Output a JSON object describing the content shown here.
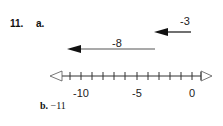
{
  "problem": {
    "number": "11.",
    "part_a": {
      "label": "a.",
      "arrows": [
        {
          "label": "-3",
          "from": 0,
          "to": -3
        },
        {
          "label": "-8",
          "from": -3,
          "to": -11
        }
      ],
      "number_line": {
        "min_tick": -11,
        "max_tick": 1,
        "labels": [
          {
            "value": -10,
            "text": "-10"
          },
          {
            "value": -5,
            "text": "-5"
          },
          {
            "value": 0,
            "text": "0"
          }
        ]
      }
    },
    "part_b": {
      "label": "b.",
      "answer": "−11"
    }
  }
}
